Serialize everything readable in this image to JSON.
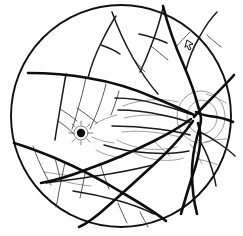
{
  "diagram": {
    "background_color": "#ffffff",
    "ink_color": "#0d0d0d",
    "canvas": {
      "width": 243,
      "height": 236
    }
  },
  "globe": {
    "label": "fundus-globe-boundary",
    "center_x": 121,
    "center_y": 116,
    "radius_x": 110,
    "radius_y": 111,
    "stroke": "#101010",
    "stroke_width": 1.9
  },
  "optic_disc": {
    "label": "optic-disc",
    "center_x": 201,
    "center_y": 117,
    "radius_outer": 24,
    "radius_inner": 15,
    "stroke": "#8a8a8a"
  },
  "lesion": {
    "label": "macular-lesion-spot",
    "center_x": 81,
    "center_y": 133,
    "radius": 5,
    "color": "#0a0a0a",
    "description": "dark stellate pigment spot at macula"
  },
  "marker": {
    "label": "pointer-annotation-mark",
    "x": 188,
    "y": 44,
    "glyph": "arrow-pointer",
    "color": "#101010"
  },
  "legend": {
    "vessel_major_label": "major retinal vessel",
    "vessel_mid_label": "secondary vessel branch",
    "vessel_minor_label": "tertiary vessel branch",
    "vessel_faint_label": "fine capillary / contour",
    "disc_label": "optic disc rings",
    "lesion_label": "pigmented lesion"
  },
  "paths": {
    "major": [
      "M 163 6 C 168 26, 176 48, 184 66 C 190 80, 195 94, 198 106 C 200 112, 201 116, 201 119 C 201 124, 199 130, 197 137 C 194 148, 192 160, 192 173 C 192 188, 194 202, 197 214",
      "M 196 112 C 199 114, 203 115, 209 116 C 218 117, 227 119, 233 122",
      "M 198 123 C 200 129, 201 136, 200 144 C 199 155, 196 166, 192 177 C 188 190, 184 203, 181 214",
      "M 194 117 C 197 113, 202 108, 209 101 C 219 91, 228 82, 234 75",
      "M 193 121 C 186 131, 176 143, 164 155 C 146 172, 126 190, 108 206 C 96 217, 86 224, 79 227",
      "M 28 73 C 45 73, 66 74, 88 78 C 113 82, 137 90, 155 98 C 172 105, 186 111, 194 115",
      "M 14 143 C 24 146, 38 151, 55 158 C 76 167, 100 179, 121 192 C 140 203, 156 213, 166 221",
      "M 191 119 C 183 125, 170 133, 154 141 C 132 152, 108 162, 88 169 C 68 177, 52 181, 41 183"
    ],
    "mid": [
      "M 112 12 C 117 26, 124 42, 133 58 C 141 72, 150 85, 158 94",
      "M 163 8 C 160 20, 156 34, 151 46 C 147 57, 143 66, 140 72",
      "M 186 70 C 189 58, 194 46, 200 36 C 206 25, 212 17, 217 12",
      "M 139 34 C 148 36, 158 39, 167 43",
      "M 88 78 C 91 66, 96 53, 102 41 C 107 31, 112 22, 116 16",
      "M 101 45 C 107 47, 114 50, 120 54",
      "M 66 74 C 64 85, 62 97, 60 109 C 58 121, 56 132, 55 140",
      "M 115 98 C 128 98, 143 100, 157 104 C 170 107, 182 111, 190 114",
      "M 118 110 C 132 110, 148 112, 162 115 C 176 118, 186 121, 192 123",
      "M 112 126 C 126 126, 143 127, 158 129 C 172 131, 183 133, 190 135",
      "M 104 145 C 117 149, 133 152, 150 153 C 166 154, 180 153, 189 151",
      "M 46 183 C 60 181, 77 179, 96 176 C 117 173, 137 169, 153 165",
      "M 73 191 C 86 193, 101 196, 116 200 C 131 204, 144 209, 154 214",
      "M 199 140 C 203 146, 207 154, 210 163 C 213 172, 215 180, 216 186",
      "M 200 132 C 206 135, 213 139, 220 144 C 227 149, 232 153, 235 156"
    ],
    "minor": [
      "M 60 109 C 65 112, 71 116, 77 121",
      "M 58 121 C 63 124, 69 129, 74 134",
      "M 86 77 C 84 88, 81 99, 78 109 C 76 117, 74 124, 72 129",
      "M 106 84 C 104 93, 101 102, 98 110 C 95 118, 92 124, 90 129",
      "M 77 108 C 83 112, 90 117, 97 123",
      "M 119 91 C 117 99, 114 107, 111 115",
      "M 133 58 C 136 62, 140 67, 145 72",
      "M 151 46 C 156 50, 162 55, 168 60",
      "M 176 47 C 180 42, 185 37, 190 32",
      "M 207 35 C 211 39, 216 43, 221 47",
      "M 33 146 C 36 155, 40 164, 44 172 C 47 178, 49 182, 51 185",
      "M 55 158 C 57 166, 59 174, 61 181",
      "M 65 162 C 63 172, 61 182, 59 191 C 58 198, 57 203, 56 207",
      "M 86 169 C 84 179, 82 189, 80 198",
      "M 100 163 C 103 172, 106 181, 109 189",
      "M 140 212 C 143 218, 146 223, 148 227",
      "M 118 203 C 121 210, 124 217, 127 223"
    ],
    "faint": [
      "M 123 106 C 130 103, 139 101, 149 100 C 160 99, 170 100, 178 102",
      "M 124 118 C 132 116, 142 115, 152 115 C 163 115, 173 117, 181 119",
      "M 122 132 C 130 131, 140 131, 151 132 C 162 133, 172 135, 180 137",
      "M 117 140 C 124 144, 134 147, 146 149 C 158 150, 169 149, 177 147",
      "M 133 152 C 140 156, 149 159, 159 160 C 169 161, 178 160, 184 158",
      "M 96 150 C 103 154, 112 157, 122 158",
      "M 95 124 C 101 120, 109 117, 117 115",
      "M 92 137 C 98 140, 106 142, 114 143",
      "M 206 94 C 213 96, 220 99, 226 103",
      "M 205 142 C 212 140, 220 139, 227 139",
      "M 196 159 C 203 160, 211 162, 218 165",
      "M 190 144 C 195 150, 199 157, 202 164",
      "M 154 141 C 159 146, 164 151, 170 156",
      "M 62 181 C 70 183, 80 185, 91 186",
      "M 44 172 C 52 173, 62 175, 72 176"
    ]
  }
}
